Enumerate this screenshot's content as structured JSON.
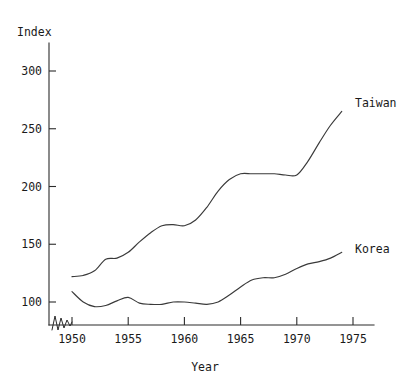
{
  "chart_data": {
    "type": "line",
    "title": "",
    "subtitle": "",
    "xlabel": "Year",
    "ylabel": "Index",
    "xlim": [
      1949.5,
      1975.5
    ],
    "ylim": [
      80,
      320
    ],
    "grid": false,
    "legend_position": "inline-right-of-line-end",
    "x_ticks": [
      1950,
      1955,
      1960,
      1965,
      1970,
      1975
    ],
    "x_tick_labels": [
      "1950",
      "1955",
      "1960",
      "1965",
      "1970",
      "1975"
    ],
    "y_ticks": [
      100,
      150,
      200,
      250,
      300
    ],
    "y_tick_labels": [
      "100",
      "150",
      "200",
      "250",
      "300"
    ],
    "y_axis_break": true,
    "y_axis_break_note": "zigzag break symbol at base of vertical axis near origin",
    "series": [
      {
        "name": "Taiwan",
        "label": "Taiwan",
        "label_x": 1975.0,
        "label_y": 272,
        "x": [
          1950,
          1951,
          1952,
          1953,
          1954,
          1955,
          1956,
          1957,
          1958,
          1959,
          1960,
          1961,
          1962,
          1963,
          1964,
          1965,
          1966,
          1967,
          1968,
          1969,
          1970,
          1971,
          1972,
          1973,
          1974
        ],
        "values": [
          122,
          123,
          127,
          137,
          138,
          143,
          152,
          160,
          166,
          167,
          166,
          171,
          182,
          196,
          206,
          211,
          211,
          211,
          211,
          210,
          210,
          222,
          238,
          253,
          265
        ]
      },
      {
        "name": "Korea",
        "label": "Korea",
        "label_x": 1975.0,
        "label_y": 146,
        "x": [
          1950,
          1951,
          1952,
          1953,
          1954,
          1955,
          1956,
          1957,
          1958,
          1959,
          1960,
          1961,
          1962,
          1963,
          1964,
          1965,
          1966,
          1967,
          1968,
          1969,
          1970,
          1971,
          1972,
          1973,
          1974
        ],
        "values": [
          109,
          100,
          96,
          97,
          101,
          104,
          99,
          98,
          98,
          100,
          100,
          99,
          98,
          100,
          106,
          113,
          119,
          121,
          121,
          124,
          129,
          133,
          135,
          138,
          143
        ]
      }
    ],
    "colors": {
      "line": "#3a3a3a",
      "axis": "#2b2b2b",
      "text": "#1a1a1a",
      "background": "#ffffff"
    }
  }
}
